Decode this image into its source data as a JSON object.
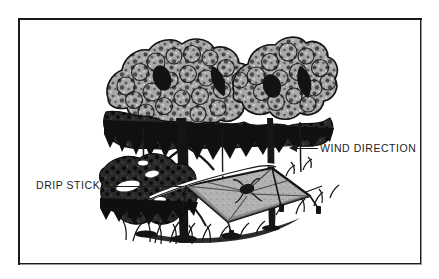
{
  "figure": {
    "background_color": "#ffffff",
    "frame_color": "#1a1a1a",
    "ink_color": "#1c1c1c",
    "foliage_gray": "#a8a8a8",
    "tarp_gray": "#b0b0b0",
    "shadow_black": "#111111"
  },
  "callouts": {
    "wind_direction": {
      "label": "WIND DIRECTION",
      "icon": "left-arrow-icon",
      "arrow_direction": "left"
    },
    "drip_stick": {
      "label": "DRIP STICK",
      "icon": "leader-line-icon"
    }
  },
  "scene": {
    "elements": [
      "tree-canopy",
      "tree-trunks",
      "tarp-shelter",
      "guy-lines",
      "ground-vegetation",
      "gear-on-tarp"
    ]
  }
}
